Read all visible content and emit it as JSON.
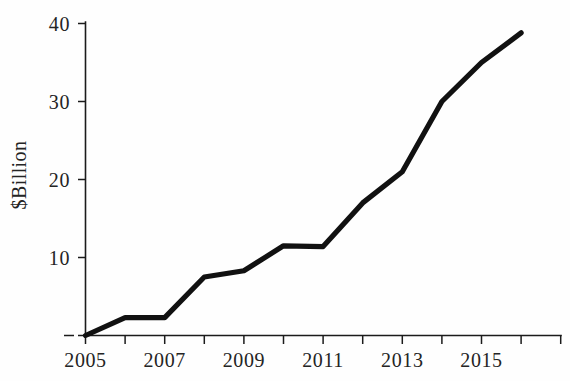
{
  "chart_data": {
    "type": "line",
    "title": "",
    "subtitle": "",
    "xlabel": "",
    "ylabel": "$Billion",
    "x": [
      2005,
      2006,
      2007,
      2008,
      2009,
      2010,
      2011,
      2012,
      2013,
      2014,
      2015,
      2016
    ],
    "values": [
      0,
      2.3,
      2.3,
      7.5,
      8.3,
      11.5,
      11.4,
      17.0,
      21.0,
      30.0,
      35.0,
      38.8
    ],
    "series": [
      {
        "name": "$Billion",
        "values": [
          0,
          2.3,
          2.3,
          7.5,
          8.3,
          11.5,
          11.4,
          17.0,
          21.0,
          30.0,
          35.0,
          38.8
        ]
      }
    ],
    "xlim": [
      2005,
      2017
    ],
    "ylim": [
      0,
      40
    ],
    "grid": false,
    "legend": "none",
    "y_ticks": [
      0,
      10,
      20,
      30,
      40
    ],
    "y_tick_labels": [
      "",
      "10",
      "20",
      "30",
      "40"
    ],
    "x_ticks": [
      2005,
      2006,
      2007,
      2008,
      2009,
      2010,
      2011,
      2012,
      2013,
      2014,
      2015,
      2016,
      2017
    ],
    "x_tick_labels": [
      "2005",
      "",
      "2007",
      "",
      "2009",
      "",
      "2011",
      "",
      "2013",
      "",
      "2015",
      "",
      ""
    ],
    "line_color": "#111111",
    "axis_color": "#1b1b1b",
    "background_color": "#fefefe"
  },
  "axes": {
    "y_labels": [
      {
        "text": "40",
        "value": 40
      },
      {
        "text": "30",
        "value": 30
      },
      {
        "text": "20",
        "value": 20
      },
      {
        "text": "10",
        "value": 10
      },
      {
        "text": "",
        "value": 0
      }
    ],
    "x_labels": [
      {
        "text": "2005",
        "value": 2005
      },
      {
        "text": "2007",
        "value": 2007
      },
      {
        "text": "2009",
        "value": 2009
      },
      {
        "text": "2011",
        "value": 2011
      },
      {
        "text": "2013",
        "value": 2013
      },
      {
        "text": "2015",
        "value": 2015
      }
    ],
    "y_axis_title": "$Billion"
  }
}
